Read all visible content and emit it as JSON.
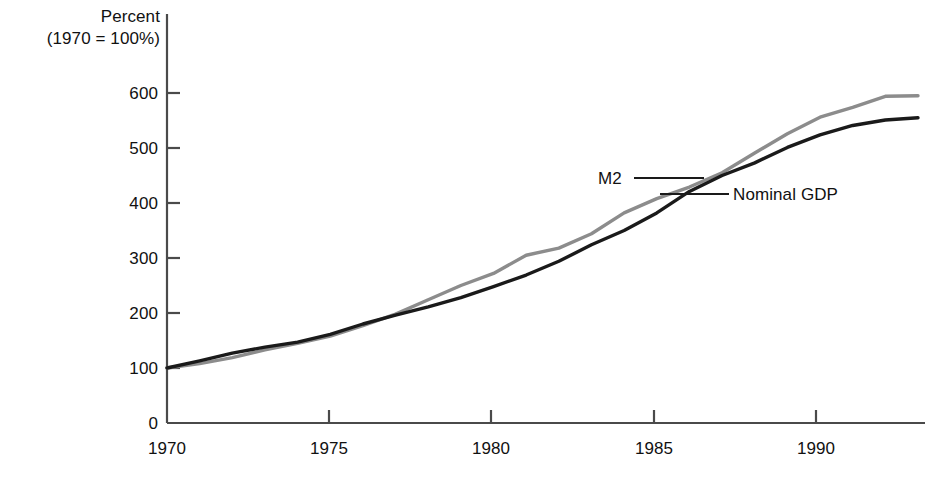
{
  "caption": {
    "line1": "Percent",
    "line2": "(1970 = 100%)"
  },
  "axes": {
    "y_ticks": [
      "0",
      "100",
      "200",
      "300",
      "400",
      "500",
      "600"
    ],
    "x_ticks": [
      "1970",
      "1975",
      "1980",
      "1985",
      "1990"
    ]
  },
  "series_labels": {
    "m2": "M2",
    "nominal_gdp": "Nominal GDP"
  },
  "colors": {
    "m2": "#1a1a1a",
    "nominal_gdp": "#8c8c8c",
    "axis": "#4a4a4a",
    "background": "#ffffff"
  },
  "chart_data": {
    "type": "line",
    "title": "",
    "subtitle": "",
    "xlabel": "",
    "ylabel": "Percent (1970 = 100%)",
    "xlim": [
      1970,
      1993
    ],
    "ylim": [
      0,
      600
    ],
    "yticks": [
      0,
      100,
      200,
      300,
      400,
      500,
      600
    ],
    "xticks": [
      1970,
      1975,
      1980,
      1985,
      1990
    ],
    "grid": false,
    "legend": "inline-annotation",
    "x": [
      1970,
      1971,
      1972,
      1973,
      1974,
      1975,
      1976,
      1977,
      1978,
      1979,
      1980,
      1981,
      1982,
      1983,
      1984,
      1985,
      1986,
      1987,
      1988,
      1989,
      1990,
      1991,
      1992,
      1993
    ],
    "series": [
      {
        "name": "M2",
        "color": "#1a1a1a",
        "values": [
          100,
          113,
          127,
          138,
          147,
          161,
          180,
          196,
          211,
          228,
          248,
          269,
          294,
          324,
          350,
          382,
          421,
          450,
          473,
          501,
          524,
          541,
          551,
          555
        ]
      },
      {
        "name": "Nominal GDP",
        "color": "#8c8c8c",
        "values": [
          100,
          108,
          119,
          133,
          145,
          158,
          177,
          198,
          224,
          250,
          272,
          305,
          318,
          344,
          382,
          408,
          429,
          455,
          491,
          526,
          556,
          574,
          594,
          595
        ]
      }
    ]
  },
  "annotations": {
    "m2_leader": "leader line from M2 label to black curve",
    "ngdp_leader": "leader line from Nominal GDP label to gray curve"
  }
}
